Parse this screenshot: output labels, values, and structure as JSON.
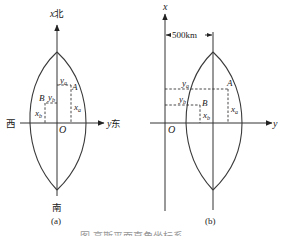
{
  "figure_a": {
    "x_axis_label": "x",
    "north_label": "北",
    "south_label": "南",
    "west_label": "西",
    "y_axis_label": "y",
    "east_label": "东",
    "origin_label": "O",
    "point_a_label": "A",
    "point_b_label": "B",
    "ya_label": "y",
    "ya_sub": "a",
    "yb_label": "y",
    "yb_sub": "b",
    "xa_label": "x",
    "xa_sub": "a",
    "xb_label": "x",
    "xb_sub": "b",
    "panel_label": "(a)"
  },
  "figure_b": {
    "x_axis_label": "x",
    "y_axis_label": "y",
    "origin_label": "O",
    "offset_label": "500km",
    "point_a_label": "A",
    "point_b_label": "B",
    "ya_label": "y",
    "ya_sub": "a",
    "yb_label": "y",
    "yb_sub": "b",
    "xa_label": "x",
    "xa_sub": "a",
    "xb_label": "x",
    "xb_sub": "b",
    "panel_label": "(b)"
  },
  "caption": "图 高斯平面直角坐标系"
}
